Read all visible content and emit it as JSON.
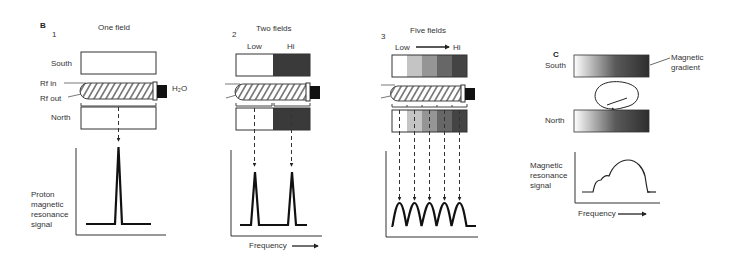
{
  "figure": {
    "panel_b": {
      "label": "B",
      "sub1": {
        "number": "1",
        "title": "One field",
        "south": "South",
        "north": "North",
        "rf_in": "Rf in",
        "rf_out": "Rf out",
        "h2o": "H₂O",
        "ylabel": [
          "Proton",
          "magnetic",
          "resonance",
          "signal"
        ],
        "fields": [
          {
            "shade": "#ffffff"
          }
        ]
      },
      "sub2": {
        "number": "2",
        "title": "Two fields",
        "low": "Low",
        "hi": "Hi",
        "xlabel": "Frequency",
        "fields": [
          {
            "shade": "#ffffff"
          },
          {
            "shade": "#3a3a3a"
          }
        ]
      },
      "sub3": {
        "number": "3",
        "title": "Five fields",
        "low": "Low",
        "hi": "Hi",
        "fields": [
          {
            "shade": "#ffffff"
          },
          {
            "shade": "#c4c4c4"
          },
          {
            "shade": "#959595"
          },
          {
            "shade": "#676767"
          },
          {
            "shade": "#444444"
          }
        ]
      }
    },
    "panel_c": {
      "label": "C",
      "south": "South",
      "north": "North",
      "gradient_label": [
        "Magnetic",
        "gradient"
      ],
      "ylabel": [
        "Magnetic",
        "resonance",
        "signal"
      ],
      "xlabel": "Frequency",
      "gradient_colors": [
        "#ffffff",
        "#2e2e2e"
      ]
    }
  }
}
